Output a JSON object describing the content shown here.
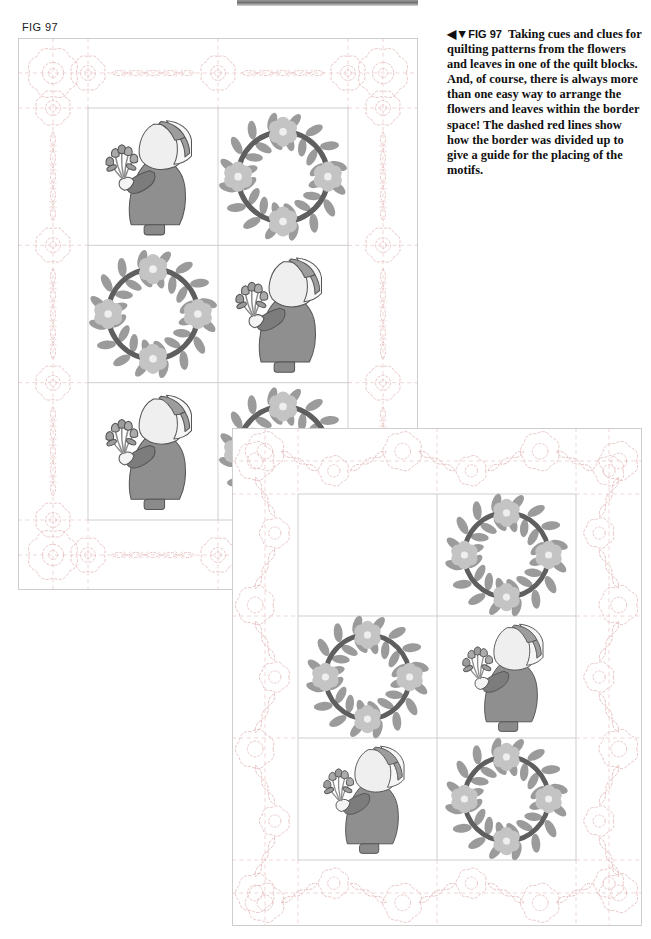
{
  "page": {
    "fig_label": "FIG 97",
    "background_color": "#ffffff"
  },
  "caption": {
    "arrow_glyph": "◀▼",
    "fig_ref": "FIG 97",
    "text": "Taking cues and clues for quilting patterns from the flowers and leaves in one of the quilt blocks. And, of course, there is always more than one easy way to arrange the flowers and leaves within the border space! The dashed red lines show how the border was divided up to give a guide for the placing of the motifs."
  },
  "palette": {
    "dress": "#8f8f8f",
    "dress_dark": "#7c7c7c",
    "bonnet": "#efefef",
    "bonnet_band": "#9d9d9d",
    "shoe": "#8a8a8a",
    "outline": "#555555",
    "wreath_ring": "#5f5f5f",
    "leaf": "#9b9b9b",
    "flower": "#c4c4c4",
    "flower_center": "#efefef",
    "quilt_line": "#c9c9c9",
    "dashed_red": "#e3b9b9",
    "dashed_red_strong": "#d9a7a7",
    "stem": "#8d8d8d"
  },
  "quilts": [
    {
      "name": "quilt-top-left",
      "x": 18,
      "y": 38,
      "width": 400,
      "height": 552,
      "border_width": 70,
      "border_style": "flower-and-leaf-chain",
      "blocks_cols": 2,
      "blocks_rows": 3,
      "block_layout": [
        [
          "sunbonnet-sue",
          "flower-wreath"
        ],
        [
          "flower-wreath",
          "sunbonnet-sue"
        ],
        [
          "sunbonnet-sue",
          "flower-wreath"
        ]
      ]
    },
    {
      "name": "quilt-bottom-right",
      "x": 232,
      "y": 428,
      "width": 410,
      "height": 498,
      "border_width": 66,
      "border_style": "vine-and-round-flower",
      "blocks_cols": 2,
      "blocks_rows": 3,
      "block_layout": [
        [
          "blank",
          "flower-wreath"
        ],
        [
          "flower-wreath",
          "sunbonnet-sue"
        ],
        [
          "sunbonnet-sue",
          "flower-wreath"
        ]
      ]
    }
  ],
  "motifs": {
    "sunbonnet_sue": "Sunbonnet Sue appliqué figure holding a bouquet of tulips",
    "flower_wreath": "Circular wreath of flowers and leaves appliqué",
    "border_quilting": "Dashed red quilting guide lines with flower and leaf motifs"
  }
}
